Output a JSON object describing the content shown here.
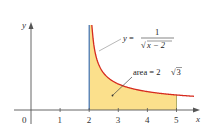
{
  "chart_data": {
    "type": "area",
    "title": "",
    "function": "y = 1/sqrt(x - 2)",
    "xlabel": "x",
    "ylabel": "y",
    "xlim": [
      0,
      5.8
    ],
    "ylim": [
      0,
      3.3
    ],
    "origin_label": "0",
    "x_ticks": [
      1,
      2,
      3,
      4,
      5
    ],
    "x_tick_labels": [
      "1",
      "2",
      "3",
      "4",
      "5"
    ],
    "grid": false,
    "curve": {
      "x_start": 2.09,
      "x_end": 5.6,
      "color": "#d62b1e"
    },
    "shaded_region": {
      "x_from": 2,
      "x_to": 5,
      "fill": "#fbe08c",
      "left_edge_color": "#3b6fb6",
      "right_edge_color": "#9a9a50"
    },
    "annotations": [
      {
        "id": "function",
        "text_lhs": "y =",
        "numerator": "1",
        "denominator": "x − 2",
        "radical": "√"
      },
      {
        "id": "area",
        "text": "area = 2",
        "radical": "√",
        "radicand": "3"
      }
    ]
  }
}
